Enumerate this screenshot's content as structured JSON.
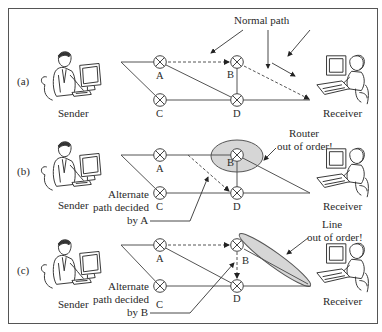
{
  "frame": {
    "border_color": "#555555",
    "background": "#ffffff"
  },
  "annotations": {
    "normal_path": "Normal path",
    "router_out_line1": "Router",
    "router_out_line2": "out of order!",
    "line_out_line1": "Line",
    "line_out_line2": "out of order!",
    "alt_a_line1": "Alternate",
    "alt_a_line2": "path decided",
    "alt_a_line3": "by A",
    "alt_b_line1": "Alternate",
    "alt_b_line2": "path decided",
    "alt_b_line3": "by B"
  },
  "panels": [
    {
      "id": "a",
      "label": "(a)",
      "sender": "Sender",
      "receiver": "Receiver",
      "nodes": {
        "A": "A",
        "B": "B",
        "C": "C",
        "D": "D"
      },
      "scenario": "Normal path"
    },
    {
      "id": "b",
      "label": "(b)",
      "sender": "Sender",
      "receiver": "Receiver",
      "nodes": {
        "A": "A",
        "B": "B",
        "C": "C",
        "D": "D"
      },
      "scenario": "Router out of order"
    },
    {
      "id": "c",
      "label": "(c)",
      "sender": "Sender",
      "receiver": "Receiver",
      "nodes": {
        "A": "A",
        "B": "B",
        "C": "C",
        "D": "D"
      },
      "scenario": "Line out of order"
    }
  ],
  "colors": {
    "highlight_fill": "#d6d6d6",
    "line": "#555555",
    "text": "#2a2a2a"
  }
}
